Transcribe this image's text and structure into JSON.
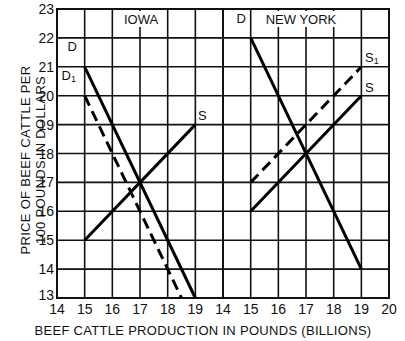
{
  "chart_data": {
    "type": "line",
    "title": "",
    "xlabel": "BEEF CATTLE PRODUCTION IN POUNDS (BILLIONS)",
    "ylabel": "PRICE OF BEEF CATTLE PER 100 POUNDS IN DOLLARS",
    "ylim": [
      13,
      23
    ],
    "y_ticks": [
      "13",
      "14",
      "15",
      "16",
      "17",
      "18",
      "19",
      "20",
      "21",
      "22",
      "23"
    ],
    "grid": true,
    "panels": [
      {
        "name": "IOWA",
        "xlim": [
          14,
          20
        ],
        "x_ticks": [
          "14",
          "15",
          "16",
          "17",
          "18",
          "19"
        ],
        "series": [
          {
            "name": "D",
            "style": "solid",
            "points": [
              [
                15,
                21
              ],
              [
                19,
                13
              ]
            ]
          },
          {
            "name": "D1",
            "style": "dashed",
            "points": [
              [
                15,
                20
              ],
              [
                18.5,
                13
              ]
            ]
          },
          {
            "name": "S",
            "style": "solid",
            "points": [
              [
                15,
                15
              ],
              [
                19,
                19
              ]
            ]
          }
        ]
      },
      {
        "name": "NEW YORK",
        "xlim": [
          14,
          20
        ],
        "x_ticks": [
          "14",
          "15",
          "16",
          "17",
          "18",
          "19",
          "20"
        ],
        "series": [
          {
            "name": "D",
            "style": "solid",
            "points": [
              [
                15,
                22
              ],
              [
                19,
                14
              ]
            ]
          },
          {
            "name": "S",
            "style": "solid",
            "points": [
              [
                15,
                16
              ],
              [
                19,
                20
              ]
            ]
          },
          {
            "name": "S1",
            "style": "dashed",
            "points": [
              [
                15,
                17
              ],
              [
                19,
                21
              ]
            ]
          }
        ]
      }
    ]
  },
  "labels": {
    "ylabel_line1": "PRICE OF BEEF CATTLE PER",
    "ylabel_line2": "100 POUNDS IN DOLLARS",
    "xlabel": "BEEF CATTLE PRODUCTION IN POUNDS (BILLIONS)",
    "panel_iowa": "IOWA",
    "panel_ny": "NEW YORK",
    "iowa_D": "D",
    "iowa_D1": "D",
    "iowa_D1_sub": "1",
    "iowa_S": "S",
    "ny_D": "D",
    "ny_S": "S",
    "ny_S1": "S",
    "ny_S1_sub": "1"
  }
}
